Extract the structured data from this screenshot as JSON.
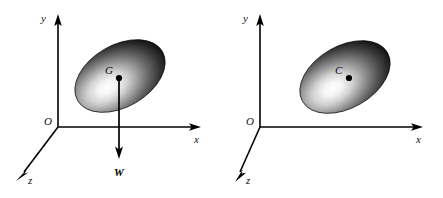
{
  "figure": {
    "background_color": "#ffffff",
    "ink_color": "#000000",
    "width": 443,
    "height": 198,
    "panel_count": 2
  },
  "panels": [
    {
      "id": "left-panel",
      "name": "weight-force-diagram",
      "origin_label": "O",
      "axes": [
        {
          "name": "y-axis",
          "label": "y",
          "direction": "up"
        },
        {
          "name": "x-axis",
          "label": "x",
          "direction": "right"
        },
        {
          "name": "z-axis",
          "label": "z",
          "direction": "down-left"
        }
      ],
      "body": {
        "name": "ellipsoid-body",
        "shape": "ellipse",
        "rotation_deg": -30,
        "fill": "radial-gradient-white-to-black",
        "highlight_color": "#ffffff",
        "edge_color": "#0c0c0c"
      },
      "point": {
        "name": "center-of-gravity",
        "label": "G",
        "marker": "filled-dot"
      },
      "vector": {
        "name": "weight-vector",
        "label": "W",
        "direction": "downward",
        "arrowhead": "solid"
      }
    },
    {
      "id": "right-panel",
      "name": "centroid-diagram",
      "origin_label": "O",
      "axes": [
        {
          "name": "y-axis",
          "label": "y",
          "direction": "up"
        },
        {
          "name": "x-axis",
          "label": "x",
          "direction": "right"
        },
        {
          "name": "z-axis",
          "label": "z",
          "direction": "down-left"
        }
      ],
      "body": {
        "name": "ellipsoid-body",
        "shape": "ellipse",
        "rotation_deg": -30,
        "fill": "radial-gradient-white-to-black",
        "highlight_color": "#ffffff",
        "edge_color": "#0c0c0c"
      },
      "point": {
        "name": "centroid",
        "label": "C",
        "marker": "filled-dot"
      },
      "vector": null
    }
  ]
}
